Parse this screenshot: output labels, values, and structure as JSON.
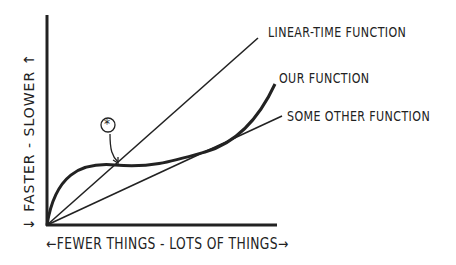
{
  "diagram": {
    "type": "line",
    "x_axis_label": "←FEWER THINGS - LOTS OF THINGS→",
    "y_axis_label": "↓ FASTER - SLOWER ↑",
    "annotation_marker": "⊛",
    "series": [
      {
        "name": "LINEAR-TIME FUNCTION",
        "shape": "straight line through origin, steepest"
      },
      {
        "name": "OUR FUNCTION",
        "shape": "rises quickly, plateaus, crosses linear line at marked point, then rises again"
      },
      {
        "name": "SOME OTHER FUNCTION",
        "shape": "straight line through origin, shallow slope"
      }
    ],
    "colors": {
      "ink": "#222222",
      "background": "#ffffff"
    }
  },
  "labels": {
    "linear": "LINEAR-TIME FUNCTION",
    "ours": "OUR FUNCTION",
    "other": "SOME OTHER FUNCTION",
    "xaxis": "←FEWER THINGS - LOTS OF THINGS→",
    "yaxis": "↓     FASTER  -  SLOWER  ↑",
    "marker": "*"
  }
}
